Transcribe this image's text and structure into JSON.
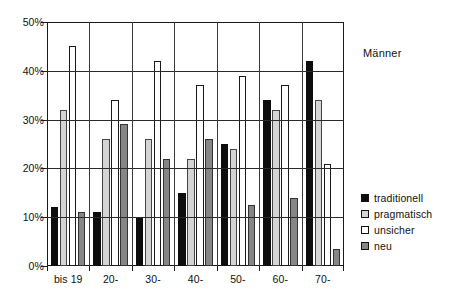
{
  "chart_data": {
    "type": "bar",
    "title": "Männer",
    "xlabel": "",
    "ylabel": "",
    "ylim": [
      0,
      50
    ],
    "ytick_labels": [
      "0%",
      "10%",
      "20%",
      "30%",
      "40%",
      "50%"
    ],
    "ytick_values": [
      0,
      10,
      20,
      30,
      40,
      50
    ],
    "grid": "horizontal-and-vertical",
    "legend_position": "right",
    "categories": [
      "bis 19",
      "20-",
      "30-",
      "40-",
      "50-",
      "60-",
      "70-"
    ],
    "series": [
      {
        "name": "traditionell",
        "color": "#0d0d0d",
        "values": [
          12,
          11,
          10,
          15,
          25,
          34,
          42
        ]
      },
      {
        "name": "pragmatisch",
        "color": "#d4d4d4",
        "values": [
          32,
          26,
          26,
          22,
          24,
          32,
          34
        ]
      },
      {
        "name": "unsicher",
        "color": "#ffffff",
        "values": [
          45,
          34,
          42,
          37,
          39,
          37,
          21
        ]
      },
      {
        "name": "neu",
        "color": "#868686",
        "values": [
          11,
          29,
          22,
          26,
          12.5,
          14,
          3.5
        ]
      }
    ]
  }
}
